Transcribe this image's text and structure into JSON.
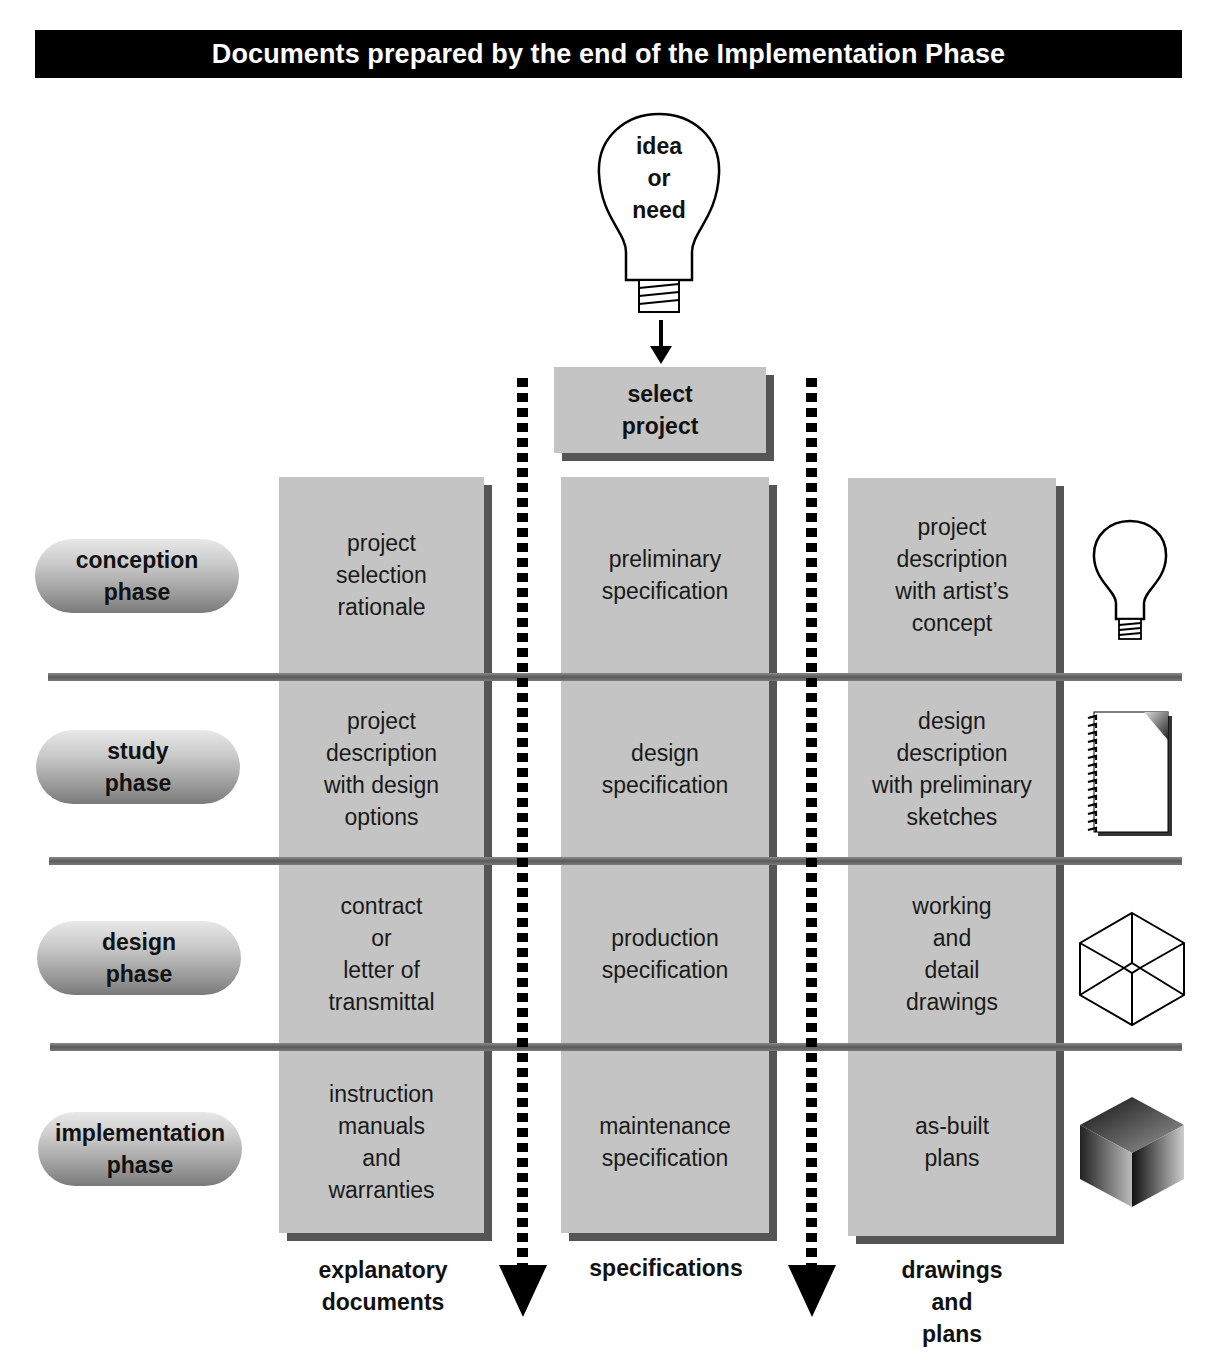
{
  "title": "Documents prepared by the end of the Implementation Phase",
  "start": {
    "bulb_label": "idea\nor\nneed",
    "bulb_lines": [
      "idea",
      "or",
      "need"
    ],
    "select_box_lines": [
      "select",
      "project"
    ]
  },
  "phases": [
    {
      "lines": [
        "conception",
        "phase"
      ],
      "icon": "lightbulb-icon"
    },
    {
      "lines": [
        "study",
        "phase"
      ],
      "icon": "notepad-icon"
    },
    {
      "lines": [
        "design",
        "phase"
      ],
      "icon": "wireframe-cube-icon"
    },
    {
      "lines": [
        "implementation",
        "phase"
      ],
      "icon": "solid-cube-icon"
    }
  ],
  "columns": [
    {
      "footer": [
        "explanatory",
        "documents"
      ]
    },
    {
      "footer": [
        "specifications"
      ]
    },
    {
      "footer": [
        "drawings",
        "and",
        "plans"
      ]
    }
  ],
  "cells": [
    [
      [
        "project",
        "selection",
        "rationale"
      ],
      [
        "preliminary",
        "specification"
      ],
      [
        "project",
        "description",
        "with artist’s",
        "concept"
      ]
    ],
    [
      [
        "project",
        "description",
        "with design",
        "options"
      ],
      [
        "design",
        "specification"
      ],
      [
        "design",
        "description",
        "with preliminary",
        "sketches"
      ]
    ],
    [
      [
        "contract",
        "or",
        "letter of",
        "transmittal"
      ],
      [
        "production",
        "specification"
      ],
      [
        "working",
        "and",
        "detail",
        "drawings"
      ]
    ],
    [
      [
        "instruction",
        "manuals",
        "and",
        "warranties"
      ],
      [
        "maintenance",
        "specification"
      ],
      [
        "as-built",
        "plans"
      ]
    ]
  ],
  "colors": {
    "title_bg": "#000000",
    "cell_fill": "#c4c4c4",
    "cell_shadow": "#555555",
    "separator": "#6a6a6a"
  }
}
